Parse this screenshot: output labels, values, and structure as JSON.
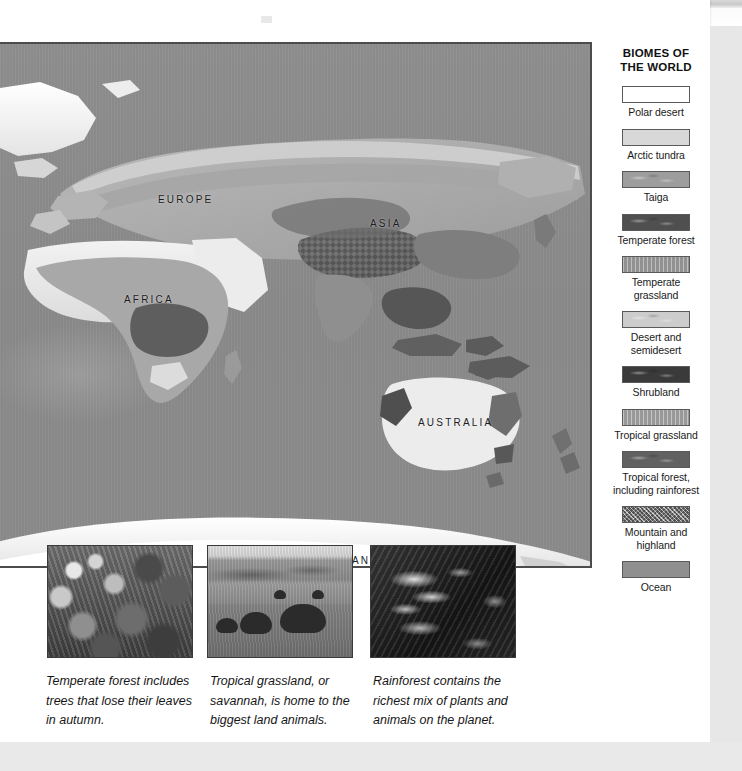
{
  "legend": {
    "title_line1": "BIOMES OF",
    "title_line2": "THE WORLD",
    "items": [
      {
        "label": "Polar desert",
        "color": "#ffffff",
        "pattern": "plain"
      },
      {
        "label": "Arctic tundra",
        "color": "#d8d8d8",
        "pattern": "plain"
      },
      {
        "label": "Taiga",
        "color": "#9d9d9d",
        "pattern": "mottle"
      },
      {
        "label": "Temperate forest",
        "color": "#4f4f4f",
        "pattern": "mottle"
      },
      {
        "label": "Temperate grassland",
        "color": "#a2a2a2",
        "pattern": "stripe"
      },
      {
        "label": "Desert and\nsemidesert",
        "color": "#cccccc",
        "pattern": "mottle"
      },
      {
        "label": "Shrubland",
        "color": "#3a3a3a",
        "pattern": "mottle"
      },
      {
        "label": "Tropical grassland",
        "color": "#aaaaaa",
        "pattern": "stripe"
      },
      {
        "label": "Tropical forest,\nincluding rainforest",
        "color": "#616161",
        "pattern": "mottle"
      },
      {
        "label": "Mountain and\nhighland",
        "color": "#8a8a8a",
        "pattern": "speckle"
      },
      {
        "label": "Ocean",
        "color": "#8f8f8f",
        "pattern": "plain"
      }
    ]
  },
  "map": {
    "labels": [
      {
        "text": "EUROPE",
        "x": 158,
        "y": 150
      },
      {
        "text": "ASIA",
        "x": 370,
        "y": 174
      },
      {
        "text": "AFRICA",
        "x": 124,
        "y": 250
      },
      {
        "text": "AUSTRALIA",
        "x": 418,
        "y": 373
      },
      {
        "text": "ANTARCTICA",
        "x": 352,
        "y": 511
      }
    ],
    "ocean_color": "#8b8b8b",
    "ice_color": "#f2f2f2"
  },
  "photos": [
    {
      "name": "temperate-forest-photo",
      "alt": "Temperate forest trees"
    },
    {
      "name": "savannah-photo",
      "alt": "Elephants on tropical grassland"
    },
    {
      "name": "rainforest-photo",
      "alt": "Dense rainforest foliage"
    }
  ],
  "captions": [
    "Temperate forest includes trees that lose their leaves in autumn.",
    "Tropical grassland, or savannah, is home to the biggest land animals.",
    "Rainforest contains the richest mix of plants and animals on the planet."
  ]
}
